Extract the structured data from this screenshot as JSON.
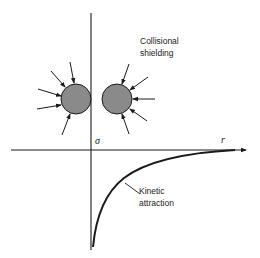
{
  "diagram": {
    "type": "potential-curve",
    "labels": {
      "shielding_line1": "Collisional",
      "shielding_line2": "shielding",
      "attraction_line1": "Kinetic",
      "attraction_line2": "attraction",
      "sigma": "σ",
      "r_axis": "r"
    },
    "colors": {
      "line": "#1a1a1a",
      "sphere_fill": "#8a8a8a",
      "background": "#ffffff"
    },
    "spheres": [
      {
        "name": "left-particle",
        "cx": 76,
        "cy": 99,
        "r": 15
      },
      {
        "name": "right-particle",
        "cx": 117,
        "cy": 99,
        "r": 15
      }
    ],
    "axes": {
      "vertical": {
        "x": 91,
        "y1": 13,
        "y2": 250
      },
      "horizontal": {
        "y": 150,
        "x1": 11,
        "x2": 248
      }
    }
  }
}
